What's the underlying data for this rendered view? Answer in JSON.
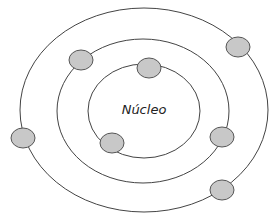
{
  "diagram": {
    "title": "Núcleo",
    "colors": {
      "orbit_stroke": "#444444",
      "electron_fill": "#c8c8c8",
      "electron_stroke": "#555555",
      "text": "#222222"
    },
    "nucleus_label": "Núcleo",
    "orbits": [
      {
        "name": "inner-orbit",
        "cx": 144,
        "cy": 111,
        "rx": 56,
        "ry": 47
      },
      {
        "name": "middle-orbit",
        "cx": 143,
        "cy": 111,
        "rx": 86,
        "ry": 72
      },
      {
        "name": "outer-orbit",
        "cx": 144,
        "cy": 110,
        "rx": 124,
        "ry": 102
      }
    ],
    "electrons": [
      {
        "orbit": "inner",
        "cx": 149,
        "cy": 68
      },
      {
        "orbit": "inner",
        "cx": 112,
        "cy": 143
      },
      {
        "orbit": "middle",
        "cx": 81,
        "cy": 60
      },
      {
        "orbit": "middle",
        "cx": 222,
        "cy": 137
      },
      {
        "orbit": "outer",
        "cx": 238,
        "cy": 47
      },
      {
        "orbit": "outer",
        "cx": 23,
        "cy": 138
      },
      {
        "orbit": "outer",
        "cx": 222,
        "cy": 190
      }
    ]
  }
}
